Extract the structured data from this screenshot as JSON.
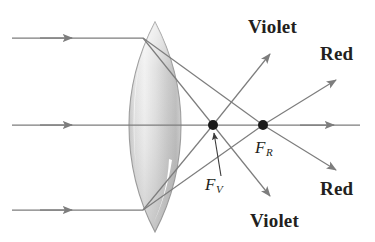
{
  "figure": {
    "background_color": "#ffffff",
    "ray_color": "#7d7d7d",
    "text_color": "#231f20",
    "lens_fill_light": "#f2f2f2",
    "lens_fill_mid": "#d9d9d9",
    "lens_fill_dark": "#b3b3b3",
    "lens_outline": "#9a9a9a"
  },
  "labels": {
    "violet_top": "Violet",
    "red_top": "Red",
    "red_bottom": "Red",
    "violet_bottom": "Violet",
    "focal_violet": "F",
    "focal_violet_sub": "V",
    "focal_red": "F",
    "focal_red_sub": "R"
  },
  "geometry": {
    "optical_axis_y": 125,
    "lens": {
      "center_x": 155,
      "top_y": 22,
      "bottom_y": 232,
      "half_width": 26
    },
    "focal_points": [
      {
        "name": "F_V",
        "x": 213,
        "y": 125,
        "radius": 5
      },
      {
        "name": "F_R",
        "x": 263,
        "y": 125,
        "radius": 5
      }
    ],
    "incoming_rays": [
      {
        "name": "upper-incoming-ray",
        "y": 38,
        "x_start": 12,
        "x_end": 140
      },
      {
        "name": "axis-incoming-ray",
        "y": 125,
        "x_start": 12,
        "x_end": 140
      },
      {
        "name": "lower-incoming-ray",
        "y": 210,
        "x_start": 12,
        "x_end": 140
      }
    ]
  }
}
